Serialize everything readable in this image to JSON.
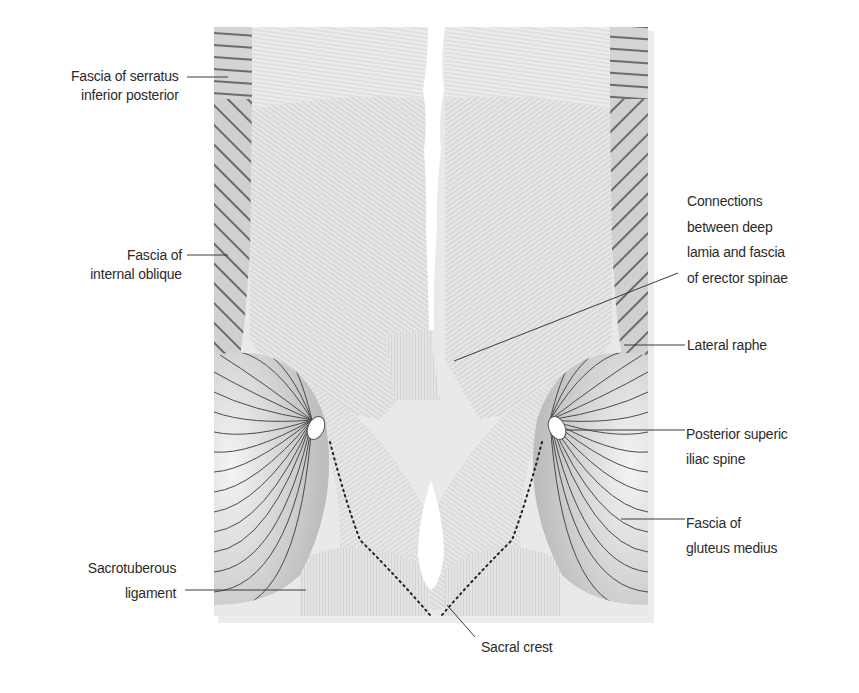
{
  "figure": {
    "colors": {
      "background": "#ffffff",
      "fascia_light": "#e6e6e6",
      "fascia_mid": "#d2d2d2",
      "hatch_dark": "#333333",
      "leader_line": "#3a3a3a",
      "label_text": "#2b2b2b"
    }
  },
  "labels": {
    "serratus": {
      "line1": "Fascia of serratus",
      "line2": "inferior posterior"
    },
    "internal_oblique": {
      "line1": "Fascia of",
      "line2": "internal oblique"
    },
    "connections": {
      "line1": "Connections",
      "line2": "between deep",
      "line3": "lamia and fascia",
      "line4": "of erector spinae"
    },
    "lateral_raphe": {
      "line1": "Lateral raphe"
    },
    "psis": {
      "line1": "Posterior superic",
      "line2": "iliac spine"
    },
    "gluteus_medius": {
      "line1": "Fascia of",
      "line2": "gluteus medius"
    },
    "sacrotuberous": {
      "line1": "Sacrotuberous",
      "line2": "ligament"
    },
    "sacral_crest": {
      "line1": "Sacral crest"
    }
  }
}
